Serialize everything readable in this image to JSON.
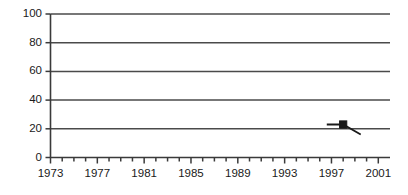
{
  "chart_data": {
    "type": "line",
    "title": "",
    "subtitle": "",
    "xlabel": "",
    "ylabel": "",
    "xlim": [
      1973,
      2002
    ],
    "ylim": [
      0,
      100
    ],
    "grid": true,
    "legend": null,
    "y_ticks": [
      0,
      20,
      40,
      60,
      80,
      100
    ],
    "y_tick_labels": [
      "0",
      "20",
      "40",
      "60",
      "80",
      "100"
    ],
    "x_ticks": [
      1973,
      1974,
      1975,
      1976,
      1977,
      1978,
      1979,
      1980,
      1981,
      1982,
      1983,
      1984,
      1985,
      1986,
      1987,
      1988,
      1989,
      1990,
      1991,
      1992,
      1993,
      1994,
      1995,
      1996,
      1997,
      1998,
      1999,
      2000,
      2001
    ],
    "x_tick_labels": [
      "1973",
      "1977",
      "1981",
      "1985",
      "1989",
      "1993",
      "1997",
      "2001"
    ],
    "x_labeled_ticks": [
      1973,
      1977,
      1981,
      1985,
      1989,
      1993,
      1997,
      2001
    ],
    "series": [
      {
        "name": "series-1",
        "marker": "square",
        "color": "#1a1a1a",
        "x": [
          1996.6,
          1998.0,
          1999.5
        ],
        "y": [
          23,
          23,
          16
        ],
        "marker_points": [
          {
            "x": 1998.0,
            "y": 23
          }
        ]
      }
    ],
    "colors": {
      "axis": "#3a3a3a",
      "grid": "#4a4a4a",
      "series": "#1a1a1a",
      "text": "#1a1a1a",
      "background": "#ffffff"
    }
  }
}
